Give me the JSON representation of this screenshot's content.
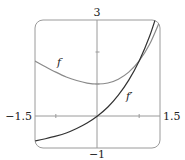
{
  "chart_data": {
    "type": "line",
    "title": "",
    "xlabel": "",
    "ylabel": "",
    "xlim": [
      -1.5,
      1.5
    ],
    "ylim": [
      -1,
      3
    ],
    "grid": false,
    "x_tick_labels": [
      "-1.5",
      "1.5"
    ],
    "y_tick_labels": [
      "3",
      "-1"
    ],
    "x_ticks": [
      -1,
      1
    ],
    "y_ticks": [
      1,
      2
    ],
    "series": [
      {
        "name": "f",
        "label": "f",
        "color": "#8a8a8a",
        "x": [
          -1.5,
          -1.25,
          -1.0,
          -0.75,
          -0.5,
          -0.25,
          0.0,
          0.25,
          0.5,
          0.75,
          1.0,
          1.25,
          1.5
        ],
        "values": [
          1.72,
          1.54,
          1.37,
          1.22,
          1.11,
          1.03,
          1.0,
          1.03,
          1.15,
          1.37,
          1.72,
          2.24,
          2.98
        ]
      },
      {
        "name": "f'",
        "label": "f′",
        "color": "#333333",
        "x": [
          -1.5,
          -1.25,
          -1.0,
          -0.75,
          -0.5,
          -0.25,
          0.0,
          0.25,
          0.5,
          0.75,
          1.0,
          1.25,
          1.5
        ],
        "values": [
          -0.78,
          -0.71,
          -0.63,
          -0.53,
          -0.39,
          -0.22,
          0.0,
          0.28,
          0.65,
          1.12,
          1.72,
          2.49,
          3.48
        ]
      }
    ],
    "annotations": [
      {
        "text": "f",
        "x": -0.95,
        "y": 1.7
      },
      {
        "text": "f′",
        "x": 0.75,
        "y": 0.6
      }
    ]
  },
  "labels": {
    "y_top": "3",
    "y_bottom": "−1",
    "x_left": "−1.5",
    "x_right": "1.5",
    "f": "f",
    "fprime": "f′"
  }
}
